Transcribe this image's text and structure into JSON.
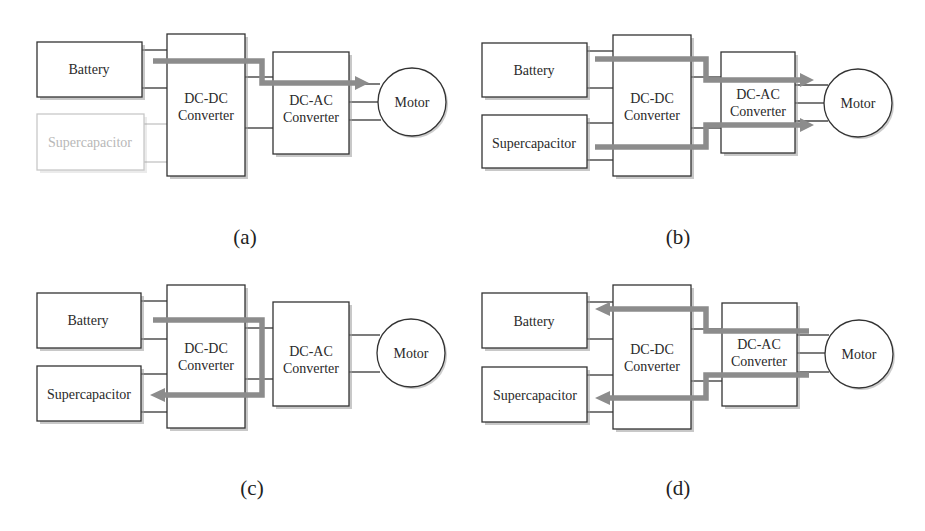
{
  "figure": {
    "panels": [
      {
        "id": "a",
        "caption": "(a)",
        "mode": "Battery supplies motor",
        "labels": {
          "battery": "Battery",
          "supercapacitor": "Supercapacitor",
          "dcdc_line1": "DC-DC",
          "dcdc_line2": "Converter",
          "dcac_line1": "DC-AC",
          "dcac_line2": "Converter",
          "motor": "Motor"
        },
        "supercapacitor_active": false,
        "flows": [
          "battery->motor"
        ]
      },
      {
        "id": "b",
        "caption": "(b)",
        "mode": "Battery and supercapacitor supply motor",
        "labels": {
          "battery": "Battery",
          "supercapacitor": "Supercapacitor",
          "dcdc_line1": "DC-DC",
          "dcdc_line2": "Converter",
          "dcac_line1": "DC-AC",
          "dcac_line2": "Converter",
          "motor": "Motor"
        },
        "supercapacitor_active": true,
        "flows": [
          "battery->motor",
          "supercapacitor->motor"
        ]
      },
      {
        "id": "c",
        "caption": "(c)",
        "mode": "Battery charges supercapacitor",
        "labels": {
          "battery": "Battery",
          "supercapacitor": "Supercapacitor",
          "dcdc_line1": "DC-DC",
          "dcdc_line2": "Converter",
          "dcac_line1": "DC-AC",
          "dcac_line2": "Converter",
          "motor": "Motor"
        },
        "supercapacitor_active": true,
        "flows": [
          "battery->supercapacitor"
        ]
      },
      {
        "id": "d",
        "caption": "(d)",
        "mode": "Regenerative braking charges battery and supercapacitor",
        "labels": {
          "battery": "Battery",
          "supercapacitor": "Supercapacitor",
          "dcdc_line1": "DC-DC",
          "dcdc_line2": "Converter",
          "dcac_line1": "DC-AC",
          "dcac_line2": "Converter",
          "motor": "Motor"
        },
        "supercapacitor_active": true,
        "flows": [
          "motor->battery",
          "motor->supercapacitor"
        ]
      }
    ],
    "colors": {
      "box_stroke": "#333333",
      "faded_stroke": "#c8c8c8",
      "flow_arrow": "#8c8c8c",
      "text": "#2a2a2a",
      "faded_text": "#b8b8b8",
      "background": "#ffffff"
    }
  }
}
